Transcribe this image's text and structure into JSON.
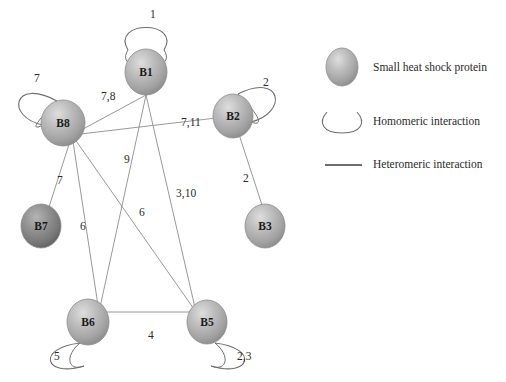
{
  "figure": {
    "type": "network-diagram",
    "background": "#ffffff",
    "node_fill": "#b6b6b6",
    "node_fill_dark": "#8a8a8a",
    "node_stroke": "#7a7a7a",
    "edge_color": "#8d8d8d",
    "loop_color": "#6e6e6e",
    "text_color": "#2a2a2a"
  },
  "nodes": [
    {
      "id": "B1",
      "label": "B1",
      "cx": 146,
      "cy": 72,
      "rx": 21,
      "ry": 23,
      "shade": "light"
    },
    {
      "id": "B2",
      "label": "B2",
      "cx": 233,
      "cy": 116,
      "rx": 20,
      "ry": 22,
      "shade": "light"
    },
    {
      "id": "B3",
      "label": "B3",
      "cx": 265,
      "cy": 226,
      "rx": 20,
      "ry": 22,
      "shade": "light"
    },
    {
      "id": "B5",
      "label": "B5",
      "cx": 207,
      "cy": 322,
      "rx": 20,
      "ry": 22,
      "shade": "light"
    },
    {
      "id": "B6",
      "label": "B6",
      "cx": 88,
      "cy": 322,
      "rx": 21,
      "ry": 23,
      "shade": "light"
    },
    {
      "id": "B7",
      "label": "B7",
      "cx": 41,
      "cy": 226,
      "rx": 20,
      "ry": 22,
      "shade": "dark"
    },
    {
      "id": "B8",
      "label": "B8",
      "cx": 63,
      "cy": 123,
      "rx": 22,
      "ry": 23,
      "shade": "light"
    }
  ],
  "hetero_edges": [
    {
      "from": "B8",
      "to": "B1",
      "label": "7,8",
      "lx": 101,
      "ly": 100
    },
    {
      "from": "B8",
      "to": "B2",
      "label": "7,11",
      "lx": 181,
      "ly": 126
    },
    {
      "from": "B8",
      "to": "B7",
      "label": "7",
      "lx": 57,
      "ly": 184
    },
    {
      "from": "B8",
      "to": "B6",
      "label": "6",
      "lx": 80,
      "ly": 230
    },
    {
      "from": "B8",
      "to": "B5",
      "label": "6",
      "lx": 139,
      "ly": 216
    },
    {
      "from": "B1",
      "to": "B6",
      "label": "9",
      "lx": 124,
      "ly": 163
    },
    {
      "from": "B1",
      "to": "B5",
      "label": "3,10",
      "lx": 176,
      "ly": 197
    },
    {
      "from": "B2",
      "to": "B3",
      "label": "2",
      "lx": 243,
      "ly": 182
    },
    {
      "from": "B6",
      "to": "B5",
      "label": "4",
      "lx": 148,
      "ly": 339
    }
  ],
  "self_loops": [
    {
      "node": "B1",
      "label": "1",
      "lx": 150,
      "ly": 18,
      "position": "top"
    },
    {
      "node": "B8",
      "label": "7",
      "lx": 34,
      "ly": 82,
      "position": "upper-left"
    },
    {
      "node": "B2",
      "label": "2",
      "lx": 263,
      "ly": 86,
      "position": "upper-right"
    },
    {
      "node": "B6",
      "label": "5",
      "lx": 54,
      "ly": 360,
      "position": "lower-left"
    },
    {
      "node": "B5",
      "label": "2,3",
      "lx": 237,
      "ly": 360,
      "position": "lower-right"
    }
  ],
  "legend": {
    "items": [
      {
        "key": "protein",
        "icon": "sphere-icon",
        "text": "Small heat shock protein"
      },
      {
        "key": "homomeric",
        "icon": "loop-icon",
        "text": "Homomeric interaction"
      },
      {
        "key": "hetero",
        "icon": "straight-line-icon",
        "text": "Heteromeric interaction"
      }
    ]
  }
}
